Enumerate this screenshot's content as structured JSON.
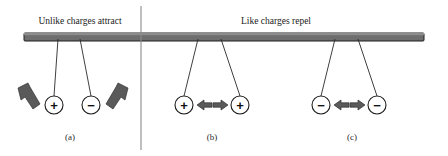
{
  "figure": {
    "background_color": "#ffffff",
    "width": 448,
    "height": 156
  },
  "headings": {
    "left": "Unlike charges attract",
    "right": "Like charges repel"
  },
  "support_bar": {
    "name": "horizontal-support-bar",
    "x": 24,
    "y": 33,
    "width": 400,
    "height": 8,
    "fill_color": "#6e6e6e",
    "stroke_color": "#1f1f1f"
  },
  "divider": {
    "name": "vertical-divider-line",
    "x": 141,
    "y_top": 6,
    "y_bottom": 150,
    "color": "#8a8a8a"
  },
  "panels": [
    {
      "id": "a",
      "label": "(a)",
      "label_x": 70,
      "label_y": 138,
      "description": "Unlike charges attract",
      "charges": [
        {
          "sign": "+",
          "name": "charge-positive-a",
          "cx": 54,
          "cy": 105,
          "r": 9,
          "anchor_x": 58,
          "anchor_y": 38
        },
        {
          "sign": "−",
          "name": "charge-negative-a",
          "cx": 91,
          "cy": 105,
          "r": 9,
          "anchor_x": 80,
          "anchor_y": 38
        }
      ],
      "arrows": [
        {
          "name": "force-arrow-left-inward",
          "direction": "down-right",
          "tip_x": 42,
          "tip_y": 110,
          "tail_x": 19,
          "tail_y": 90
        },
        {
          "name": "force-arrow-right-inward",
          "direction": "down-left",
          "tip_x": 104,
          "tip_y": 110,
          "tail_x": 127,
          "tail_y": 90
        }
      ]
    },
    {
      "id": "b",
      "label": "(b)",
      "label_x": 212,
      "label_y": 138,
      "description": "Like positive charges repel",
      "charges": [
        {
          "sign": "+",
          "name": "charge-positive-b-left",
          "cx": 184,
          "cy": 105,
          "r": 9,
          "anchor_x": 198,
          "anchor_y": 38
        },
        {
          "sign": "+",
          "name": "charge-positive-b-right",
          "cx": 240,
          "cy": 105,
          "r": 9,
          "anchor_x": 221,
          "anchor_y": 38
        }
      ],
      "arrows": [
        {
          "name": "force-arrow-b-left-outward",
          "direction": "left",
          "tip_x": 198,
          "tip_y": 105,
          "tail_x": 212,
          "tail_y": 105
        },
        {
          "name": "force-arrow-b-right-outward",
          "direction": "right",
          "tip_x": 227,
          "tip_y": 105,
          "tail_x": 213,
          "tail_y": 105
        }
      ]
    },
    {
      "id": "c",
      "label": "(c)",
      "label_x": 352,
      "label_y": 138,
      "description": "Like negative charges repel",
      "charges": [
        {
          "sign": "−",
          "name": "charge-negative-c-left",
          "cx": 321,
          "cy": 105,
          "r": 9,
          "anchor_x": 335,
          "anchor_y": 38
        },
        {
          "sign": "−",
          "name": "charge-negative-c-right",
          "cx": 377,
          "cy": 105,
          "r": 9,
          "anchor_x": 358,
          "anchor_y": 38
        }
      ],
      "arrows": [
        {
          "name": "force-arrow-c-left-outward",
          "direction": "left",
          "tip_x": 335,
          "tip_y": 105,
          "tail_x": 349,
          "tail_y": 105
        },
        {
          "name": "force-arrow-c-right-outward",
          "direction": "right",
          "tip_x": 364,
          "tip_y": 105,
          "tail_x": 350,
          "tail_y": 105
        }
      ]
    }
  ],
  "colors": {
    "arrow_fill": "#5a5a5a",
    "arrow_stroke": "#303030",
    "bar_fill": "#6e6e6e",
    "text": "#1a1a1a",
    "thread": "#2a2a2a"
  }
}
